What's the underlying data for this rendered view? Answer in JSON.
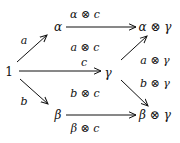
{
  "diagram": {
    "type": "commutative-diagram",
    "nodes": [
      {
        "id": "one",
        "label": "1",
        "x": 8,
        "y": 71
      },
      {
        "id": "alpha",
        "label": "α",
        "x": 57,
        "y": 27
      },
      {
        "id": "alpha_gamma",
        "label": "α ⊗ γ",
        "x": 153,
        "y": 27
      },
      {
        "id": "gamma",
        "label": "γ",
        "x": 107,
        "y": 72
      },
      {
        "id": "beta",
        "label": "β",
        "x": 57,
        "y": 115
      },
      {
        "id": "beta_gamma",
        "label": "β ⊗ γ",
        "x": 153,
        "y": 115
      }
    ],
    "edges": [
      {
        "from": "one",
        "to": "alpha",
        "label": "a"
      },
      {
        "from": "one",
        "to": "gamma",
        "label": "c"
      },
      {
        "from": "one",
        "to": "beta",
        "label": "b"
      },
      {
        "from": "alpha",
        "to": "alpha_gamma",
        "label": "α ⊗ c"
      },
      {
        "from": "gamma",
        "to": "alpha_gamma",
        "label": "a ⊗ γ"
      },
      {
        "from": "gamma",
        "to": "beta_gamma",
        "label": "b ⊗ γ"
      },
      {
        "from": "beta",
        "to": "beta_gamma",
        "label": "β ⊗ c"
      }
    ],
    "cell_labels": [
      {
        "label": "a ⊗ c"
      },
      {
        "label": "b ⊗ c"
      }
    ]
  }
}
